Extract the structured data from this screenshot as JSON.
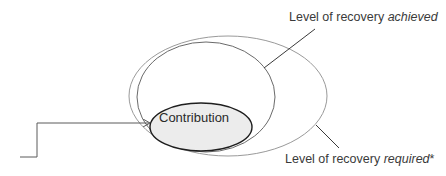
{
  "diagram": {
    "labels": {
      "achieved_prefix": "Level of recovery ",
      "achieved_emph": "achieved",
      "required_prefix": "Level of recovery ",
      "required_emph": "required",
      "required_suffix": "*",
      "contribution": "Contribution"
    },
    "shapes": {
      "required_ellipse": {
        "cx": 228,
        "cy": 96,
        "rx": 99,
        "ry": 60,
        "stroke": "#9a9a9a"
      },
      "achieved_ellipse": {
        "cx": 206,
        "cy": 97,
        "rx": 69,
        "ry": 55,
        "stroke": "#6a6a6a"
      },
      "contribution_ellipse": {
        "cx": 201,
        "cy": 127,
        "rx": 51,
        "ry": 24,
        "stroke": "#1e1e1e",
        "fill": "#ececec"
      }
    },
    "colors": {
      "connector": "#5a5a5a",
      "text": "#3a3a3a"
    }
  }
}
